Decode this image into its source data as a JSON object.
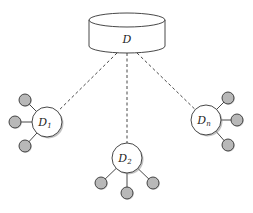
{
  "diagram": {
    "colors": {
      "stroke": "#333333",
      "node_fill": "#ffffff",
      "leaf_fill": "#b8b8b8",
      "shadow": "#9a9a9a"
    },
    "database": {
      "label": "D",
      "cx": 127,
      "top": 20,
      "bottom": 46,
      "rx": 38,
      "ry": 7
    },
    "nodes": [
      {
        "id": "d1",
        "label": "D",
        "subscript": "1",
        "cx": 47,
        "cy": 122,
        "r": 15,
        "leaves": [
          {
            "cx": 25,
            "cy": 100
          },
          {
            "cx": 15,
            "cy": 122
          },
          {
            "cx": 25,
            "cy": 146
          }
        ]
      },
      {
        "id": "d2",
        "label": "D",
        "subscript": "2",
        "cx": 127,
        "cy": 158,
        "r": 15,
        "leaves": [
          {
            "cx": 101,
            "cy": 183
          },
          {
            "cx": 127,
            "cy": 193
          },
          {
            "cx": 153,
            "cy": 183
          }
        ]
      },
      {
        "id": "dn",
        "label": "D",
        "subscript": "n",
        "cx": 206,
        "cy": 120,
        "r": 15,
        "leaves": [
          {
            "cx": 228,
            "cy": 98
          },
          {
            "cx": 237,
            "cy": 120
          },
          {
            "cx": 228,
            "cy": 145
          }
        ]
      }
    ],
    "leaf_radius": 6
  }
}
